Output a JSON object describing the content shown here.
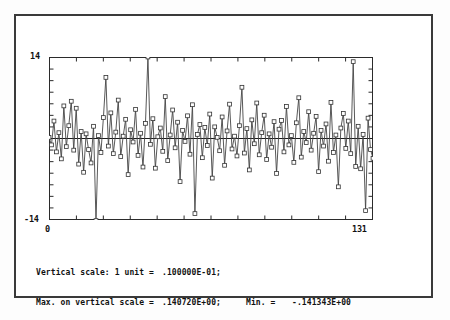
{
  "axes": {
    "y_top_label": "14",
    "y_bottom_label": "-14",
    "x_left_label": "0",
    "x_right_label": "131"
  },
  "caption": {
    "line1_key": "Vertical scale: 1 unit =",
    "line1_value": ".100000E-01;",
    "line2_key": "Max. on vertical scale =",
    "line2_value": ".140720E+00;",
    "line2_min_key": "Min. =",
    "line2_min_value": "-.141343E+00"
  },
  "chart_data": {
    "type": "line",
    "title": "",
    "xlabel": "",
    "ylabel": "",
    "xlim": [
      0,
      131
    ],
    "ylim": [
      -14,
      14
    ],
    "grid": false,
    "legend": null,
    "marker": "open-square",
    "zero_line": 0,
    "y_unit_value": 0.01,
    "y_max_value": 0.14072,
    "y_min_value": -0.141343,
    "x": [
      0,
      1,
      2,
      3,
      4,
      5,
      6,
      7,
      8,
      9,
      10,
      11,
      12,
      13,
      14,
      15,
      16,
      17,
      18,
      19,
      20,
      21,
      22,
      23,
      24,
      25,
      26,
      27,
      28,
      29,
      30,
      31,
      32,
      33,
      34,
      35,
      36,
      37,
      38,
      39,
      40,
      41,
      42,
      43,
      44,
      45,
      46,
      47,
      48,
      49,
      50,
      51,
      52,
      53,
      54,
      55,
      56,
      57,
      58,
      59,
      60,
      61,
      62,
      63,
      64,
      65,
      66,
      67,
      68,
      69,
      70,
      71,
      72,
      73,
      74,
      75,
      76,
      77,
      78,
      79,
      80,
      81,
      82,
      83,
      84,
      85,
      86,
      87,
      88,
      89,
      90,
      91,
      92,
      93,
      94,
      95,
      96,
      97,
      98,
      99,
      100,
      101,
      102,
      103,
      104,
      105,
      106,
      107,
      108,
      109,
      110,
      111,
      112,
      113,
      114,
      115,
      116,
      117,
      118,
      119,
      120,
      121,
      122,
      123,
      124,
      125,
      126,
      127,
      128,
      129,
      130,
      131
    ],
    "values": [
      0.2,
      -1.1,
      3.0,
      -2.3,
      1.0,
      -3.5,
      5.6,
      -1.4,
      2.2,
      6.4,
      -2.0,
      5.2,
      -4.4,
      1.2,
      -5.8,
      0.8,
      -1.9,
      -4.2,
      2.1,
      -14.1,
      0.5,
      -2.4,
      3.6,
      10.5,
      -1.3,
      4.4,
      -2.6,
      1.1,
      6.6,
      -3.1,
      0.4,
      3.3,
      -6.2,
      1.5,
      -0.6,
      5.0,
      -2.9,
      0.9,
      -4.9,
      2.6,
      14.0,
      -1.0,
      3.4,
      -5.1,
      0.3,
      1.8,
      -2.2,
      7.2,
      -3.8,
      0.6,
      4.9,
      -1.6,
      2.8,
      -7.4,
      1.4,
      -0.5,
      3.9,
      -2.7,
      5.8,
      -12.9,
      0.7,
      2.4,
      -3.3,
      1.9,
      -1.2,
      4.2,
      -6.8,
      2.0,
      0.2,
      -2.1,
      3.7,
      -4.6,
      1.3,
      5.9,
      -1.8,
      0.4,
      -3.0,
      2.2,
      8.8,
      -2.5,
      1.7,
      -5.4,
      3.2,
      -0.9,
      6.1,
      -2.8,
      1.0,
      4.0,
      -3.6,
      0.8,
      -1.5,
      2.9,
      -6.0,
      1.6,
      3.1,
      -2.3,
      5.5,
      -1.1,
      0.5,
      -4.1,
      2.7,
      7.0,
      -3.2,
      1.2,
      -0.7,
      4.6,
      -2.0,
      0.9,
      3.8,
      -5.7,
      1.4,
      -1.3,
      2.5,
      -3.9,
      6.2,
      -2.4,
      0.6,
      -8.3,
      1.8,
      4.3,
      -1.7,
      3.0,
      -2.6,
      13.2,
      -4.8,
      2.1,
      -5.2,
      0.7,
      -12.4,
      3.5,
      -1.9,
      -3.4
    ]
  }
}
